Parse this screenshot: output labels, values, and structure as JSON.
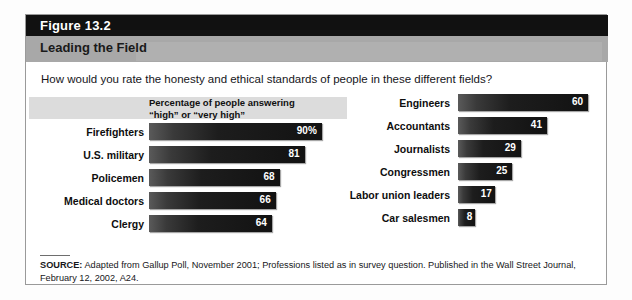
{
  "figure": {
    "number": "Figure 13.2",
    "title": "Leading the Field",
    "question": "How would you rate the honesty and ethical standards of people in these different fields?",
    "legend_line1": "Percentage of people answering",
    "legend_line2": "“high” or “very high”",
    "source_label": "SOURCE:",
    "source_text": " Adapted from Gallup Poll, November 2001; Professions listed as in survey question. Published in the Wall Street Journal, February 12, 2002, A24."
  },
  "colors": {
    "header_band": "#111111",
    "title_band": "#a8a8a8",
    "bar": "#1b1b1b",
    "legend_band": "#dcdcdc",
    "frame_border": "#9a9a9a",
    "value_text": "#ffffff"
  },
  "chart_data": {
    "type": "bar",
    "title": "Leading the Field",
    "subtitle": "How would you rate the honesty and ethical standards of people in these different fields?",
    "xlabel": "Percentage of people answering “high” or “very high”",
    "ylabel": "",
    "orientation": "horizontal",
    "xlim": [
      0,
      100
    ],
    "grid": false,
    "legend": "none",
    "categories": [
      "Firefighters",
      "U.S. military",
      "Policemen",
      "Medical doctors",
      "Clergy",
      "Engineers",
      "Accountants",
      "Journalists",
      "Congressmen",
      "Labor union leaders",
      "Car salesmen"
    ],
    "values": [
      90,
      81,
      68,
      66,
      64,
      60,
      41,
      29,
      25,
      17,
      8
    ],
    "columns": [
      {
        "name": "left-column",
        "rows": [
          {
            "label": "Firefighters",
            "value": 90,
            "value_label": "90%"
          },
          {
            "label": "U.S. military",
            "value": 81,
            "value_label": "81"
          },
          {
            "label": "Policemen",
            "value": 68,
            "value_label": "68"
          },
          {
            "label": "Medical doctors",
            "value": 66,
            "value_label": "66"
          },
          {
            "label": "Clergy",
            "value": 64,
            "value_label": "64"
          }
        ]
      },
      {
        "name": "right-column",
        "rows": [
          {
            "label": "Engineers",
            "value": 60,
            "value_label": "60"
          },
          {
            "label": "Accountants",
            "value": 41,
            "value_label": "41"
          },
          {
            "label": "Journalists",
            "value": 29,
            "value_label": "29"
          },
          {
            "label": "Congressmen",
            "value": 25,
            "value_label": "25"
          },
          {
            "label": "Labor union leaders",
            "value": 17,
            "value_label": "17"
          },
          {
            "label": "Car salesmen",
            "value": 8,
            "value_label": "8"
          }
        ]
      }
    ]
  }
}
